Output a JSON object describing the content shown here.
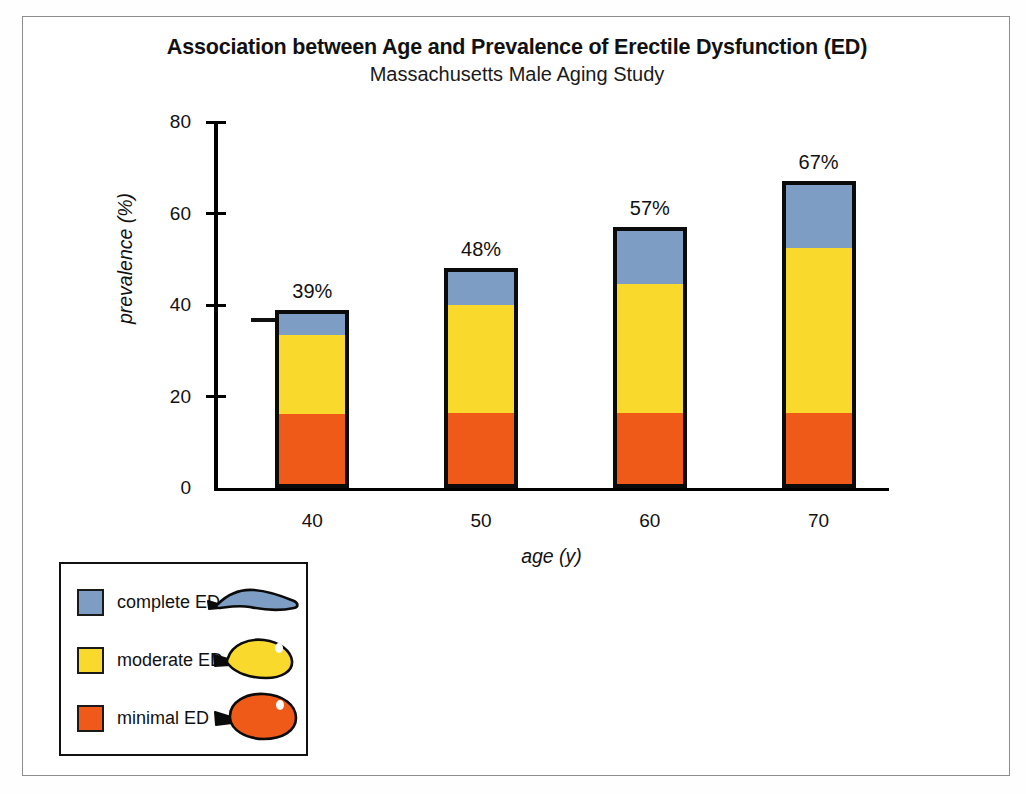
{
  "figure": {
    "title": "Association between Age and Prevalence of Erectile Dysfunction (ED)",
    "subtitle": "Massachusetts Male Aging Study",
    "frame_color": "#8d8d8d",
    "background": "#ffffff"
  },
  "colors": {
    "complete_ed": "#7d9dc4",
    "moderate_ed": "#f8d92c",
    "minimal_ed": "#ef5a18",
    "bar_outline": "#0b0b0b",
    "axis": "#000000",
    "text": "#111111"
  },
  "axes": {
    "y_label": "prevalence (%)",
    "x_label": "age (y)",
    "y_ticks": [
      "0",
      "20",
      "40",
      "60",
      "80"
    ],
    "x_ticks": [
      "40",
      "50",
      "60",
      "70"
    ]
  },
  "legend": {
    "items": [
      {
        "label": "complete ED",
        "color": "#7d9dc4",
        "balloon": "deflated-balloon-icon"
      },
      {
        "label": "moderate ED",
        "color": "#f8d92c",
        "balloon": "partially-inflated-balloon-icon"
      },
      {
        "label": "minimal ED",
        "color": "#ef5a18",
        "balloon": "inflated-balloon-icon"
      }
    ]
  },
  "chart_data": {
    "type": "bar",
    "subtype": "stacked",
    "title": "Association between Age and Prevalence of Erectile Dysfunction (ED)",
    "subtitle": "Massachusetts Male Aging Study",
    "xlabel": "age (y)",
    "ylabel": "prevalence (%)",
    "ylim": [
      0,
      80
    ],
    "yticks": [
      0,
      20,
      40,
      60,
      80
    ],
    "grid": false,
    "legend_position": "bottom-left",
    "categories": [
      "40",
      "50",
      "60",
      "70"
    ],
    "series": [
      {
        "name": "minimal ED",
        "color": "#ef5a18",
        "values": [
          16,
          16,
          16,
          16
        ]
      },
      {
        "name": "moderate ED",
        "color": "#f8d92c",
        "values": [
          18,
          24.5,
          29,
          37
        ]
      },
      {
        "name": "complete ED",
        "color": "#7d9dc4",
        "values": [
          5,
          7.5,
          12,
          14
        ]
      }
    ],
    "totals": [
      39,
      48,
      57,
      67
    ],
    "data_labels": [
      "39%",
      "48%",
      "57%",
      "67%"
    ],
    "annotations": [
      {
        "type": "stray-dash",
        "value_y": 36,
        "note": "short horizontal dash left of first bar"
      }
    ]
  }
}
